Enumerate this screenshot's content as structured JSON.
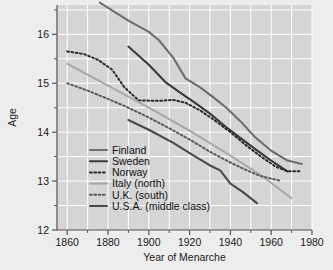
{
  "chart_data": {
    "type": "line",
    "title": "",
    "xlabel": "Year of Menarche",
    "ylabel": "Age",
    "xlim": [
      1855,
      1980
    ],
    "ylim": [
      12,
      16.6
    ],
    "xticks": [
      1860,
      1880,
      1900,
      1920,
      1940,
      1960,
      1980
    ],
    "xtick_labels": [
      "1860",
      "1880",
      "1900",
      "1920",
      "1940",
      "1960",
      "1980"
    ],
    "yticks": [
      12,
      13,
      14,
      15,
      16
    ],
    "ytick_labels": [
      "12",
      "13",
      "14",
      "15",
      "16"
    ],
    "yminorticks": [
      12.5,
      13.5,
      14.5,
      15.5,
      16.5
    ],
    "xgrid": [
      1860,
      1870,
      1880,
      1890,
      1900,
      1910,
      1920,
      1930,
      1940,
      1950,
      1960,
      1970,
      1980
    ],
    "ygrid": [
      12.5,
      13,
      13.5,
      14,
      14.5,
      15,
      15.5,
      16,
      16.5
    ],
    "grid": true,
    "legend_position": "lower-left-inside",
    "plot_bg": "#d5d5d5",
    "grid_color": "#ffffff",
    "page_bg": "#ededed",
    "series": [
      {
        "name": "Finland",
        "color": "#6e6e6e",
        "style": "solid",
        "width": 2.1,
        "x": [
          1876,
          1890,
          1900,
          1905,
          1912,
          1918,
          1925,
          1932,
          1938,
          1945,
          1952,
          1960,
          1968,
          1975
        ],
        "values": [
          16.65,
          16.28,
          16.05,
          15.88,
          15.52,
          15.1,
          14.92,
          14.7,
          14.5,
          14.22,
          13.9,
          13.62,
          13.42,
          13.35
        ]
      },
      {
        "name": "Sweden",
        "color": "#3a3a3a",
        "style": "solid",
        "width": 2.1,
        "x": [
          1890,
          1900,
          1908,
          1915,
          1922,
          1930,
          1938,
          1945,
          1952,
          1960,
          1968
        ],
        "values": [
          15.75,
          15.38,
          15.03,
          14.82,
          14.62,
          14.38,
          14.1,
          13.88,
          13.66,
          13.42,
          13.2
        ]
      },
      {
        "name": "Norway",
        "color": "#2b2b2b",
        "style": "dotted",
        "width": 2.0,
        "x": [
          1860,
          1868,
          1875,
          1882,
          1888,
          1895,
          1905,
          1912,
          1918,
          1925,
          1932,
          1940,
          1948,
          1955,
          1962,
          1968,
          1972,
          1975
        ],
        "values": [
          15.65,
          15.6,
          15.48,
          15.28,
          14.92,
          14.65,
          14.64,
          14.66,
          14.6,
          14.45,
          14.25,
          14.0,
          13.72,
          13.5,
          13.3,
          13.2,
          13.2,
          13.2
        ]
      },
      {
        "name": "Italy (north)",
        "color": "#a8a8a8",
        "style": "solid",
        "width": 2.0,
        "x": [
          1860,
          1880,
          1900,
          1920,
          1940,
          1955,
          1970
        ],
        "values": [
          15.4,
          14.95,
          14.5,
          14.03,
          13.52,
          13.12,
          12.65
        ]
      },
      {
        "name": "U.K. (south)",
        "color": "#595959",
        "style": "dotted",
        "width": 2.0,
        "x": [
          1860,
          1870,
          1880,
          1890,
          1900,
          1910,
          1920,
          1930,
          1940,
          1948,
          1955,
          1960,
          1965
        ],
        "values": [
          15.0,
          14.85,
          14.68,
          14.5,
          14.3,
          14.08,
          13.85,
          13.6,
          13.38,
          13.22,
          13.1,
          13.05,
          13.0
        ]
      },
      {
        "name": "U.S.A. (middle class)",
        "color": "#4a4a4a",
        "style": "solid",
        "width": 2.1,
        "x": [
          1890,
          1900,
          1912,
          1922,
          1930,
          1935,
          1940,
          1946,
          1953
        ],
        "values": [
          14.25,
          14.05,
          13.78,
          13.52,
          13.32,
          13.22,
          12.95,
          12.78,
          12.55
        ]
      }
    ]
  },
  "legend": {
    "items": [
      {
        "label": "Finland"
      },
      {
        "label": "Sweden"
      },
      {
        "label": "Norway"
      },
      {
        "label": "Italy (north)"
      },
      {
        "label": "U.K. (south)"
      },
      {
        "label": "U.S.A. (middle class)"
      }
    ]
  }
}
